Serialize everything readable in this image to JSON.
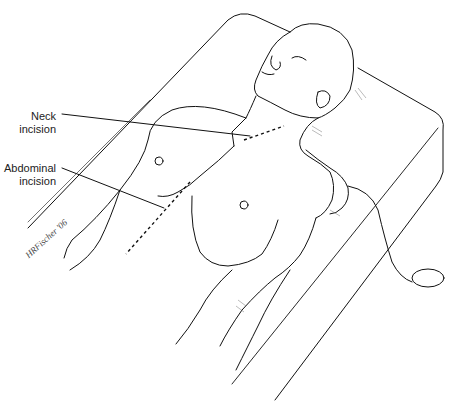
{
  "figure": {
    "labels": {
      "neck": {
        "line1": "Neck",
        "line2": "incision"
      },
      "abdominal": {
        "line1": "Abdominal",
        "line2": "incision"
      }
    },
    "signature": "HRFischer '06",
    "colors": {
      "line": "#111111",
      "hatch": "#777777",
      "background": "#ffffff"
    }
  }
}
